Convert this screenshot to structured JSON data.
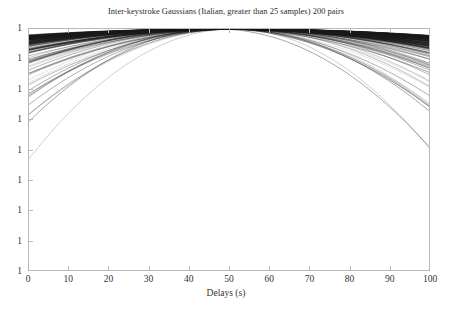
{
  "chart_data": {
    "type": "line",
    "title": "Inter-keystroke Gaussians (Italian, greater than 25 samples) 200 pairs",
    "xlabel": "Delays (s)",
    "ylabel": "",
    "xlim": [
      0,
      100
    ],
    "ylim_decades": 9,
    "yscale": "log",
    "xscale": "linear",
    "grid": false,
    "legend": null,
    "series_count": 200,
    "x_tick_labels": [
      "0",
      "10",
      "20",
      "30",
      "40",
      "50",
      "60",
      "70",
      "80",
      "90",
      "100"
    ],
    "x_tick_values": [
      0,
      10,
      20,
      30,
      40,
      50,
      60,
      70,
      80,
      90,
      100
    ],
    "y_tick_labels": [
      "1",
      "1",
      "1",
      "1",
      "1",
      "1",
      "1",
      "1",
      "1"
    ],
    "y_tick_decade_index": [
      0,
      1,
      2,
      3,
      4,
      5,
      6,
      7,
      8
    ],
    "series_description": "200 normalized Gaussian curves plotted on a logarithmic vertical axis; all peak at value 1 near Delays = 48-52 s, forming a dense dark bundle, with tails falling across 8 decades toward both ends of the x range.",
    "series": [
      {
        "name": "pair-001",
        "peak_x": 50.0,
        "peak_y": 1.0,
        "sigma": 46.0,
        "shade": 0.42
      },
      {
        "name": "pair-002",
        "peak_x": 50.5,
        "peak_y": 1.0,
        "sigma": 44.0,
        "shade": 0.36
      },
      {
        "name": "pair-003",
        "peak_x": 49.0,
        "peak_y": 1.0,
        "sigma": 42.0,
        "shade": 0.3
      },
      {
        "name": "pair-004",
        "peak_x": 51.0,
        "peak_y": 1.0,
        "sigma": 40.0,
        "shade": 0.48
      },
      {
        "name": "pair-005",
        "peak_x": 48.5,
        "peak_y": 1.0,
        "sigma": 38.0,
        "shade": 0.25
      },
      {
        "name": "pair-006",
        "peak_x": 52.0,
        "peak_y": 1.0,
        "sigma": 36.0,
        "shade": 0.55
      },
      {
        "name": "pair-007",
        "peak_x": 50.0,
        "peak_y": 1.0,
        "sigma": 34.0,
        "shade": 0.33
      },
      {
        "name": "pair-008",
        "peak_x": 47.5,
        "peak_y": 1.0,
        "sigma": 32.0,
        "shade": 0.28
      },
      {
        "name": "pair-009",
        "peak_x": 53.0,
        "peak_y": 1.0,
        "sigma": 30.0,
        "shade": 0.6
      },
      {
        "name": "pair-010",
        "peak_x": 49.5,
        "peak_y": 1.0,
        "sigma": 28.0,
        "shade": 0.38
      },
      {
        "name": "pair-011",
        "peak_x": 50.0,
        "peak_y": 1.0,
        "sigma": 26.0,
        "shade": 0.45
      },
      {
        "name": "pair-012",
        "peak_x": 51.5,
        "peak_y": 1.0,
        "sigma": 24.0,
        "shade": 0.52
      },
      {
        "name": "pair-013",
        "peak_x": 48.0,
        "peak_y": 1.0,
        "sigma": 22.0,
        "shade": 0.4
      },
      {
        "name": "pair-014",
        "peak_x": 50.0,
        "peak_y": 1.0,
        "sigma": 20.0,
        "shade": 0.62
      },
      {
        "name": "pair-015",
        "peak_x": 52.5,
        "peak_y": 1.0,
        "sigma": 18.0,
        "shade": 0.58
      },
      {
        "name": "pair-016",
        "peak_x": 49.0,
        "peak_y": 1.0,
        "sigma": 16.0,
        "shade": 0.66
      },
      {
        "name": "pair-017",
        "peak_x": 50.5,
        "peak_y": 1.0,
        "sigma": 14.0,
        "shade": 0.7
      },
      {
        "name": "pair-018",
        "peak_x": 47.0,
        "peak_y": 1.0,
        "sigma": 12.5,
        "shade": 0.72
      }
    ]
  },
  "accessibility": {
    "figure_role": "chart",
    "background_color": "#ffffff",
    "frame_color": "#b9b9b9",
    "curve_color": "#1a1a1a"
  }
}
